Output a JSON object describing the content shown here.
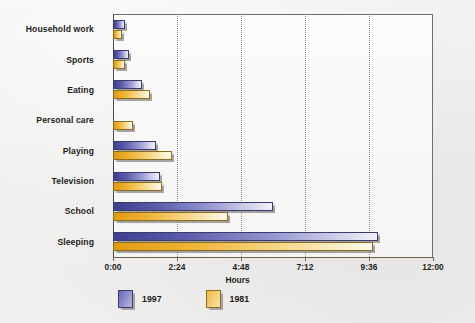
{
  "chart_data": {
    "type": "bar",
    "orientation": "horizontal",
    "title": "",
    "xlabel": "Hours",
    "ylabel": "",
    "categories": [
      "Household work",
      "Sports",
      "Eating",
      "Personal care",
      "Playing",
      "Television",
      "School",
      "Sleeping"
    ],
    "series": [
      {
        "name": "1997",
        "color": "#5c5cab",
        "values": [
          0.45,
          0.6,
          1.1,
          0.0,
          1.6,
          1.75,
          6.0,
          9.95
        ]
      },
      {
        "name": "1981",
        "color": "#efb435",
        "values": [
          0.35,
          0.45,
          1.4,
          0.75,
          2.2,
          1.85,
          4.3,
          9.75
        ]
      }
    ],
    "xlim": [
      0,
      12
    ],
    "x_tick_values": [
      0,
      2.4,
      4.8,
      7.2,
      9.6,
      12
    ],
    "x_tick_labels": [
      "0:00",
      "2:24",
      "4:48",
      "7:12",
      "9:36",
      "12:00"
    ],
    "grid": "vertical-dotted",
    "legend_position": "bottom-left"
  },
  "axis": {
    "x_title": "Hours",
    "ticks": [
      "0:00",
      "2:24",
      "4:48",
      "7:12",
      "9:36",
      "12:00"
    ]
  },
  "categories": {
    "c0": "Household work",
    "c1": "Sports",
    "c2": "Eating",
    "c3": "Personal care",
    "c4": "Playing",
    "c5": "Television",
    "c6": "School",
    "c7": "Sleeping"
  },
  "legend": {
    "series_1_label": "1997",
    "series_2_label": "1981",
    "series_1_color": "#5c5cab",
    "series_2_color": "#efb435"
  }
}
